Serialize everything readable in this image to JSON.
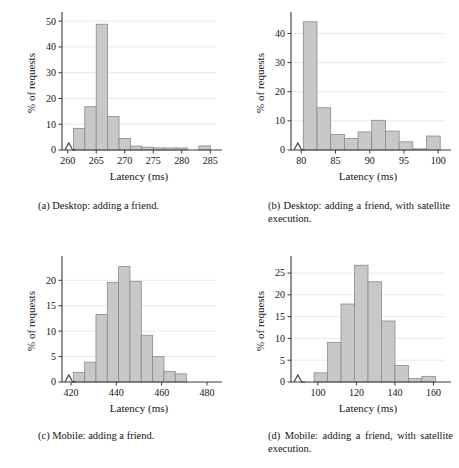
{
  "figure": {
    "panels": [
      {
        "id": "a",
        "caption": "(a) Desktop: adding a friend.",
        "chart_data": {
          "type": "bar",
          "title": "",
          "xlabel": "Latency (ms)",
          "ylabel": "% of requests",
          "xlim": [
            259,
            286
          ],
          "ylim": [
            0,
            52
          ],
          "xticks": [
            260,
            265,
            270,
            275,
            280,
            285
          ],
          "yticks": [
            0,
            10,
            20,
            30,
            40,
            50
          ],
          "grid": true,
          "axis_break_x": true,
          "bin_width": 2,
          "bin_starts": [
            261,
            263,
            265,
            267,
            269,
            271,
            273,
            275,
            277,
            279,
            281,
            283
          ],
          "categories": [
            "261-263",
            "263-265",
            "265-267",
            "267-269",
            "269-271",
            "271-273",
            "273-275",
            "275-277",
            "277-279",
            "279-281",
            "281-283",
            "283-285"
          ],
          "values": [
            8.4,
            16.8,
            48.8,
            13.0,
            4.5,
            1.5,
            1.1,
            0.8,
            0.8,
            0.8,
            0.0,
            1.6
          ]
        }
      },
      {
        "id": "b",
        "caption": "(b) Desktop: adding a friend, with satellite execution.",
        "chart_data": {
          "type": "bar",
          "title": "",
          "xlabel": "Latency (ms)",
          "ylabel": "% of requests",
          "xlim": [
            78.5,
            101
          ],
          "ylim": [
            0,
            46
          ],
          "xticks": [
            80,
            85,
            90,
            95,
            100
          ],
          "yticks": [
            0,
            10,
            20,
            30,
            40
          ],
          "grid": true,
          "axis_break_x": true,
          "bin_width": 2,
          "bin_starts": [
            80.3,
            82.3,
            84.3,
            86.3,
            88.3,
            90.3,
            92.3,
            94.3,
            96.3,
            98.3
          ],
          "categories": [
            "80-82",
            "82-84",
            "84-86",
            "86-88",
            "88-90",
            "90-92",
            "92-94",
            "94-96",
            "96-98",
            "98-100"
          ],
          "values": [
            44.0,
            14.5,
            5.3,
            4.0,
            6.2,
            10.2,
            6.5,
            2.8,
            0.4,
            4.8
          ]
        }
      },
      {
        "id": "c",
        "caption": "(c) Mobile: adding a friend.",
        "chart_data": {
          "type": "bar",
          "title": "",
          "xlabel": "Latency (ms)",
          "ylabel": "% of requests",
          "xlim": [
            416,
            484
          ],
          "ylim": [
            0,
            24
          ],
          "xticks": [
            420,
            440,
            460,
            480
          ],
          "yticks": [
            0,
            5,
            10,
            15,
            20
          ],
          "grid": true,
          "axis_break_x": true,
          "bin_width": 5,
          "bin_starts": [
            421,
            426,
            431,
            436,
            441,
            446,
            451,
            456,
            461,
            466,
            471
          ],
          "categories": [
            "421-426",
            "426-431",
            "431-436",
            "436-441",
            "441-446",
            "446-451",
            "451-456",
            "456-461",
            "461-466",
            "466-471",
            "471-476"
          ],
          "values": [
            1.9,
            3.9,
            13.3,
            19.6,
            22.7,
            19.8,
            9.2,
            5.0,
            2.1,
            1.6,
            0.0
          ]
        }
      },
      {
        "id": "d",
        "caption": "(d) Mobile: adding a friend, with satellite execution.",
        "chart_data": {
          "type": "bar",
          "title": "",
          "xlabel": "Latency (ms)",
          "ylabel": "% of requests",
          "xlim": [
            86,
            166
          ],
          "ylim": [
            0,
            28
          ],
          "xticks": [
            100,
            120,
            140,
            160
          ],
          "yticks": [
            0,
            5,
            10,
            15,
            20,
            25
          ],
          "grid": true,
          "axis_break_x": true,
          "bin_width": 7,
          "bin_starts": [
            98,
            105,
            112,
            119,
            126,
            133,
            140,
            147,
            154
          ],
          "categories": [
            "98-105",
            "105-112",
            "112-119",
            "119-126",
            "126-133",
            "133-140",
            "140-147",
            "147-154",
            "154-161"
          ],
          "values": [
            2.1,
            9.1,
            17.9,
            26.8,
            23.0,
            14.0,
            3.8,
            0.8,
            1.3
          ]
        }
      }
    ]
  },
  "style": {
    "bar_fill": "#c8c8c8",
    "bar_stroke": "#8a8a8a",
    "axis_color": "#3a3a3a",
    "grid_color": "#e2e2e2",
    "text_color": "#141414"
  }
}
